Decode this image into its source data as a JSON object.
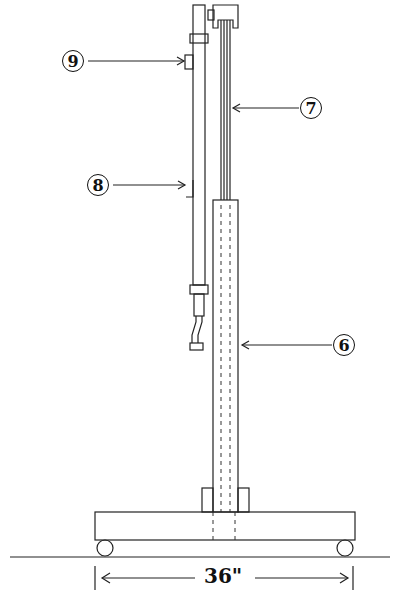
{
  "figure": {
    "type": "technical-line-drawing"
  },
  "callouts": [
    {
      "id": "9",
      "label": "9",
      "target": "upper clamp block on left rod"
    },
    {
      "id": "7",
      "label": "7",
      "target": "inner upper tube"
    },
    {
      "id": "8",
      "label": "8",
      "target": "bracket on left rod"
    },
    {
      "id": "6",
      "label": "6",
      "target": "outer lower column"
    }
  ],
  "dimension": {
    "label": "36\"",
    "span": "base width"
  }
}
